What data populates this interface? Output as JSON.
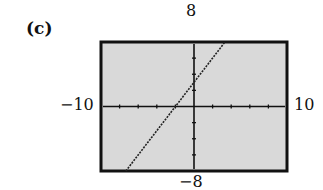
{
  "panel": {
    "label": "(c)"
  },
  "window": {
    "xmin_label": "−10",
    "xmax_label": "10",
    "ymin_label": "−8",
    "ymax_label": "8"
  },
  "colors": {
    "screen_bg": "#d9d9d9",
    "frame": "#111111",
    "line": "#222222",
    "axis": "#111111"
  },
  "chart_data": {
    "type": "line",
    "title": "(c)",
    "xlabel": "",
    "ylabel": "",
    "xlim": [
      -10,
      10
    ],
    "ylim": [
      -8,
      8
    ],
    "x_tick_step": 2,
    "y_tick_step": 2,
    "grid": false,
    "series": [
      {
        "name": "line",
        "equation": "y = 1.5x + 3",
        "x": [
          -7.33,
          3.33
        ],
        "y": [
          -8,
          8
        ],
        "style": "dotted"
      }
    ],
    "x_intercept": -2,
    "y_intercept": 3
  }
}
